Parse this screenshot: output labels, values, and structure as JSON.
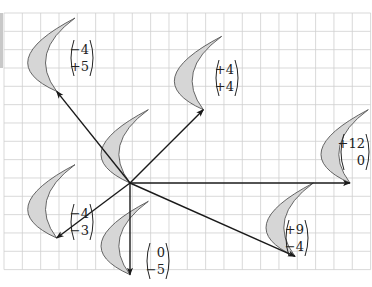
{
  "diagram": {
    "type": "translation-vectors-on-grid",
    "grid": {
      "cell_px": 18.33,
      "x0": 4,
      "y0": 13,
      "cols": 20,
      "rows": 14,
      "line_color": "#cfcfcf"
    },
    "origin": {
      "px": [
        130,
        183
      ],
      "label": "object (original crescent)"
    },
    "colors": {
      "crescent_fill": "#d6d6d6",
      "crescent_stroke": "#555555",
      "arrow": "#1a1a1a",
      "text": "#222222"
    },
    "vectors": [
      {
        "id": "v1",
        "dx": -4,
        "dy": 5,
        "top": "−4",
        "bottom": "+5",
        "label_px": [
          70,
          40
        ]
      },
      {
        "id": "v2",
        "dx": 4,
        "dy": 4,
        "top": "+4",
        "bottom": "+4",
        "label_px": [
          215,
          60
        ]
      },
      {
        "id": "v3",
        "dx": 12,
        "dy": 0,
        "top": "+12",
        "bottom": "0",
        "label_px": [
          340,
          134
        ]
      },
      {
        "id": "v4",
        "dx": 9,
        "dy": -4,
        "top": "+9",
        "bottom": "−4",
        "label_px": [
          285,
          220
        ]
      },
      {
        "id": "v5",
        "dx": 0,
        "dy": -5,
        "top": "0",
        "bottom": "−5",
        "label_px": [
          146,
          243
        ]
      },
      {
        "id": "v6",
        "dx": -4,
        "dy": -3,
        "top": "−4",
        "bottom": "−3",
        "label_px": [
          70,
          204
        ]
      }
    ]
  }
}
